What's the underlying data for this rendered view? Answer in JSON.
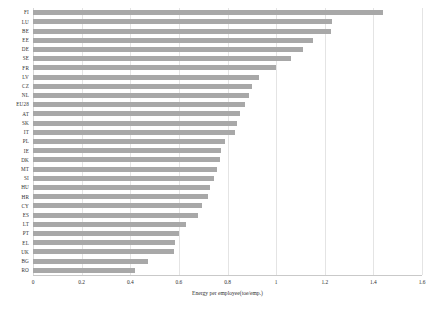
{
  "chart_data": {
    "type": "bar",
    "orientation": "horizontal",
    "title": "",
    "xlabel": "Energy per employee(toe/emp.)",
    "ylabel": "",
    "xlim": [
      0,
      1.6
    ],
    "xticks": [
      "0",
      "0.2",
      "0.4",
      "0.6",
      "0.8",
      "1",
      "1.2",
      "1.4",
      "1.6"
    ],
    "xtick_values": [
      0,
      0.2,
      0.4,
      0.6,
      0.8,
      1,
      1.2,
      1.4,
      1.6
    ],
    "grid": "vertical",
    "legend": "none",
    "bar_color": "#a8a8a8",
    "categories": [
      "FI",
      "LU",
      "BE",
      "EE",
      "DE",
      "SE",
      "FR",
      "LV",
      "CZ",
      "NL",
      "EU28",
      "AT",
      "SK",
      "IT",
      "PL",
      "IE",
      "DK",
      "MT",
      "SI",
      "HU",
      "HR",
      "CY",
      "ES",
      "LT",
      "PT",
      "EL",
      "UK",
      "BG",
      "RO"
    ],
    "values": [
      1.44,
      1.23,
      1.225,
      1.15,
      1.11,
      1.06,
      1.0,
      0.93,
      0.9,
      0.89,
      0.87,
      0.85,
      0.84,
      0.83,
      0.79,
      0.775,
      0.77,
      0.755,
      0.745,
      0.73,
      0.72,
      0.695,
      0.68,
      0.63,
      0.6,
      0.585,
      0.58,
      0.475,
      0.42
    ]
  }
}
